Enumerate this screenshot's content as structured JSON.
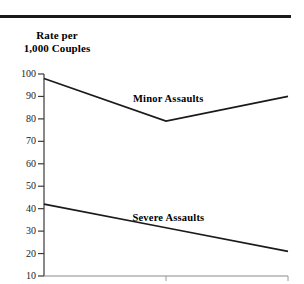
{
  "figure": {
    "name": "assault-rate-line-chart",
    "background": "#ffffff",
    "rule_color": "#1a1a1a"
  },
  "axis": {
    "title_line1": "Rate per",
    "title_line2": "1,000 Couples"
  },
  "chart_data": {
    "type": "line",
    "title": "",
    "subtitle": "",
    "xlabel": "",
    "ylabel": "Rate per 1,000 Couples",
    "ylim": [
      10,
      100
    ],
    "yticks": [
      100,
      90,
      80,
      70,
      60,
      50,
      40,
      30,
      20,
      10
    ],
    "ytick_labels": [
      "100",
      "90",
      "80",
      "70",
      "60",
      "50",
      "40",
      "30",
      "20",
      "10"
    ],
    "xlim": [
      0,
      2
    ],
    "xticks": [
      0,
      1,
      2
    ],
    "xtick_labels": [
      "",
      "",
      ""
    ],
    "grid": false,
    "legend": "inline-annotations",
    "line_color": "#1a1a1a",
    "series": [
      {
        "name": "Minor Assaults",
        "x": [
          0,
          1,
          2
        ],
        "values": [
          98,
          79,
          90
        ],
        "label": "Minor Assaults",
        "label_x": 1.02,
        "label_y": 89
      },
      {
        "name": "Severe Assaults",
        "x": [
          0,
          1,
          2
        ],
        "values": [
          42,
          31.5,
          21
        ],
        "label": "Severe Assaults",
        "label_x": 1.02,
        "label_y": 36
      }
    ],
    "annotations": [
      {
        "text": "Minor Assaults"
      },
      {
        "text": "Severe Assaults"
      }
    ]
  }
}
